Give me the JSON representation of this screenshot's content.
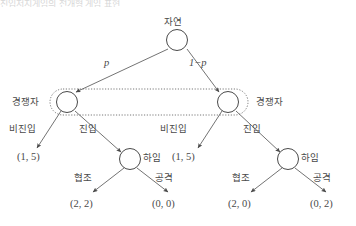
{
  "figure": {
    "cropped_header_text": "진입저지게임의 전개형 게임 표현",
    "type": "extensive-form-game-tree"
  },
  "nodes": {
    "root": {
      "label": "자연",
      "x": 177,
      "y": 40
    },
    "competitor_left": {
      "label": "경쟁자",
      "x": 67,
      "y": 102
    },
    "competitor_right": {
      "label": "경쟁자",
      "x": 228,
      "y": 102
    },
    "incumbent_left": {
      "label": "하임",
      "x": 130,
      "y": 159
    },
    "incumbent_right": {
      "label": "하임",
      "x": 288,
      "y": 159
    }
  },
  "probabilities": {
    "left": "p",
    "right": "1−p"
  },
  "actions": {
    "no_entry": "비진입",
    "entry": "진입",
    "cooperate": "협조",
    "attack": "공격"
  },
  "payoffs": {
    "left_no_entry": "(1, 5)",
    "left_cooperate": "(2, 2)",
    "left_attack": "(0, 0)",
    "right_no_entry": "(1, 5)",
    "right_cooperate": "(2, 0)",
    "right_attack": "(0, 2)"
  },
  "information_set": {
    "style": "dotted-rounded-rectangle",
    "members": [
      "경쟁자",
      "경쟁자"
    ]
  },
  "colors": {
    "line": "#5a5a5a",
    "text": "#4a4a4a",
    "background": "#ffffff",
    "dotted": "#6a6a6a"
  }
}
